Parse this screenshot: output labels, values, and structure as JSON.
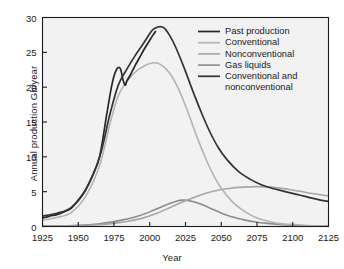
{
  "chart_data": {
    "type": "line",
    "title": "",
    "xlabel": "Year",
    "ylabel": "Annual production Gb/year",
    "xlim": [
      1925,
      2125
    ],
    "ylim": [
      0,
      30
    ],
    "xticks": [
      1925,
      1950,
      1975,
      2000,
      2025,
      2050,
      2075,
      2100,
      2125
    ],
    "yticks": [
      0,
      5,
      10,
      15,
      20,
      25,
      30
    ],
    "grid": false,
    "legend_position": "top-right inside",
    "series": [
      {
        "name": "Past production",
        "color": "#262626",
        "width": 1.7,
        "x": [
          1925,
          1930,
          1935,
          1940,
          1945,
          1950,
          1955,
          1960,
          1965,
          1970,
          1973,
          1975,
          1977,
          1979,
          1980,
          1981,
          1982,
          1983,
          1984,
          1986,
          1988,
          1990,
          1993,
          1996,
          1999,
          2002,
          2004
        ],
        "y": [
          1.2,
          1.5,
          1.7,
          2.1,
          2.6,
          3.8,
          5.2,
          7.3,
          10.1,
          16.2,
          19.8,
          21.6,
          22.6,
          22.8,
          22.3,
          21.3,
          20.6,
          20.3,
          20.9,
          21.6,
          22.4,
          23.2,
          24.3,
          25.4,
          26.4,
          27.4,
          28.0
        ]
      },
      {
        "name": "Conventional",
        "color": "#b3b3b3",
        "width": 1.6,
        "x": [
          1925,
          1935,
          1945,
          1955,
          1965,
          1972,
          1978,
          1984,
          1990,
          1995,
          2000,
          2004,
          2008,
          2014,
          2020,
          2026,
          2032,
          2038,
          2044,
          2050,
          2058,
          2066,
          2074,
          2082,
          2090,
          2098,
          2110,
          2125
        ],
        "y": [
          0.9,
          1.3,
          2.0,
          4.3,
          8.8,
          14.6,
          18.8,
          20.8,
          22.2,
          22.9,
          23.4,
          23.5,
          23.2,
          22.0,
          19.8,
          16.8,
          13.4,
          10.3,
          7.6,
          5.5,
          3.5,
          2.2,
          1.3,
          0.8,
          0.45,
          0.3,
          0.15,
          0.05
        ]
      },
      {
        "name": "Nonconventional",
        "color": "#a6a6a6",
        "width": 1.6,
        "x": [
          1925,
          1950,
          1965,
          1975,
          1985,
          1995,
          2005,
          2015,
          2025,
          2035,
          2045,
          2055,
          2065,
          2075,
          2085,
          2095,
          2105,
          2115,
          2125
        ],
        "y": [
          0.05,
          0.12,
          0.25,
          0.45,
          0.75,
          1.2,
          1.9,
          2.8,
          3.7,
          4.5,
          5.1,
          5.45,
          5.65,
          5.72,
          5.65,
          5.4,
          5.05,
          4.7,
          4.4
        ]
      },
      {
        "name": "Gas liquids",
        "color": "#8c8c8c",
        "width": 1.6,
        "x": [
          1925,
          1950,
          1965,
          1975,
          1985,
          1992,
          2000,
          2008,
          2014,
          2018,
          2022,
          2026,
          2030,
          2036,
          2042,
          2050,
          2058,
          2066,
          2074,
          2082,
          2090,
          2100,
          2112,
          2125
        ],
        "y": [
          0.03,
          0.18,
          0.4,
          0.7,
          1.1,
          1.5,
          2.1,
          2.8,
          3.3,
          3.6,
          3.78,
          3.75,
          3.6,
          3.2,
          2.65,
          1.95,
          1.35,
          0.95,
          0.65,
          0.45,
          0.3,
          0.18,
          0.1,
          0.05
        ]
      },
      {
        "name": "Conventional and nonconventional",
        "color": "#333333",
        "width": 1.7,
        "x": [
          1925,
          1935,
          1945,
          1955,
          1965,
          1972,
          1978,
          1984,
          1990,
          1996,
          2001,
          2004,
          2007,
          2010,
          2014,
          2018,
          2024,
          2030,
          2036,
          2042,
          2048,
          2054,
          2062,
          2070,
          2078,
          2086,
          2094,
          2102,
          2110,
          2118,
          2125
        ],
        "y": [
          1.5,
          1.9,
          2.7,
          5.2,
          10.0,
          16.0,
          20.3,
          22.6,
          24.6,
          26.4,
          28.0,
          28.5,
          28.7,
          28.5,
          27.4,
          25.8,
          22.8,
          19.5,
          16.4,
          13.6,
          11.3,
          9.6,
          7.9,
          6.8,
          6.0,
          5.45,
          5.05,
          4.65,
          4.25,
          3.85,
          3.6
        ]
      }
    ],
    "legend_entries": [
      {
        "label": "Past production",
        "color": "#262626"
      },
      {
        "label": "Conventional",
        "color": "#b3b3b3"
      },
      {
        "label": "Nonconventional",
        "color": "#a6a6a6"
      },
      {
        "label": "Gas liquids",
        "color": "#8c8c8c"
      },
      {
        "label": "Conventional and",
        "color": "#333333"
      },
      {
        "label": "nonconventional",
        "color": ""
      }
    ]
  },
  "axes": {
    "ylabel": "Annual production Gb/year",
    "xlabel": "Year",
    "ytick_labels": [
      "30",
      "25",
      "20",
      "15",
      "10",
      "5",
      "0"
    ],
    "xtick_labels": [
      "1925",
      "1950",
      "1975",
      "2000",
      "2025",
      "2050",
      "2075",
      "2100",
      "2125"
    ]
  },
  "style": {
    "plot_background": "#f2f2f2",
    "frame_color": "#1a1a1a",
    "page_background": "#ffffff"
  }
}
